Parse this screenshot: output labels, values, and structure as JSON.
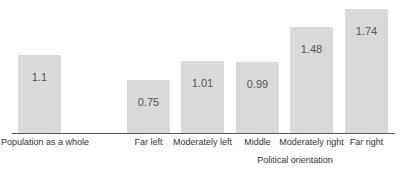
{
  "chart_data": {
    "type": "bar",
    "title": "",
    "xlabel": "Political orientation",
    "ylabel": "",
    "categories": [
      "Population as a whole",
      "Far left",
      "Moderately left",
      "Middle",
      "Moderately right",
      "Far right"
    ],
    "values": [
      1.1,
      0.75,
      1.01,
      0.99,
      1.48,
      1.74
    ],
    "value_labels": [
      "1.1",
      "0.75",
      "1.01",
      "0.99",
      "1.48",
      "1.74"
    ],
    "ylim": [
      0,
      1.8
    ],
    "grid": false,
    "legend": null,
    "bar_color": "#d9d9d9",
    "axis_color": "#555555"
  }
}
